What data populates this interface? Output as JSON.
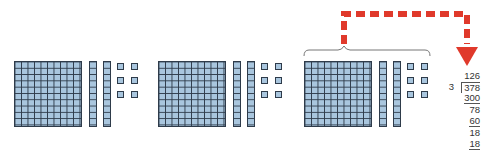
{
  "figure": {
    "groups": [
      {
        "flats": 1,
        "rods": 2,
        "units": 6,
        "value": 126
      },
      {
        "flats": 1,
        "rods": 2,
        "units": 6,
        "value": 126
      },
      {
        "flats": 1,
        "rods": 2,
        "units": 6,
        "value": 126,
        "bracketed": true
      }
    ],
    "colors": {
      "block_fill": "#a9c6de",
      "block_outline": "#2e3b4a",
      "arrow": "#e0392b"
    },
    "arrow": {
      "style": "dashed",
      "from": "bracket over third group",
      "to": "quotient 126"
    }
  },
  "long_division": {
    "quotient": "126",
    "divisor": "3",
    "dividend": "378",
    "steps": [
      {
        "subtract": "300",
        "remainder": "78"
      },
      {
        "subtract": "60",
        "remainder": "18"
      },
      {
        "subtract": "18",
        "remainder": ""
      }
    ]
  }
}
